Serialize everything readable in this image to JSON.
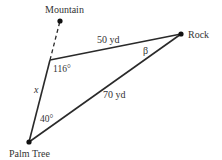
{
  "diagram": {
    "points": {
      "mountain": {
        "label": "Mountain",
        "x": 60,
        "y": 21
      },
      "vertex": {
        "x": 50,
        "y": 60
      },
      "rock": {
        "label": "Rock",
        "x": 181,
        "y": 34
      },
      "palm_tree": {
        "label": "Palm Tree",
        "x": 29,
        "y": 142
      }
    },
    "segments": {
      "vertex_rock": {
        "label": "50 yd"
      },
      "palm_rock": {
        "label": "70 yd"
      },
      "palm_vertex": {
        "label": "x"
      }
    },
    "angles": {
      "vertex": "116°",
      "palm_tree": "40°",
      "rock": "β"
    },
    "colors": {
      "line": "#2a2a2a",
      "text": "#333333"
    }
  }
}
